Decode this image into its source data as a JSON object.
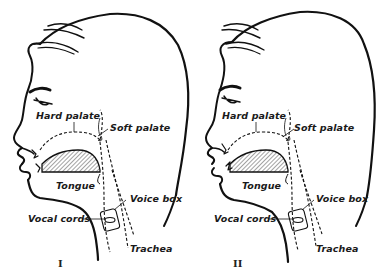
{
  "figures": [
    {
      "id": "I",
      "numeral": "I",
      "labels": {
        "hard_palate": "Hard palate",
        "soft_palate": "Soft palate",
        "tongue": "Tongue",
        "voice_box": "Voice box",
        "vocal_cords": "Vocal cords",
        "trachea": "Trachea"
      }
    },
    {
      "id": "II",
      "numeral": "II",
      "labels": {
        "hard_palate": "Hard palate",
        "soft_palate": "Soft palate",
        "tongue": "Tongue",
        "voice_box": "Voice box",
        "vocal_cords": "Vocal cords",
        "trachea": "Trachea"
      }
    }
  ],
  "colors": {
    "line": "#111111",
    "hatch": "#333333",
    "background": "#ffffff"
  }
}
